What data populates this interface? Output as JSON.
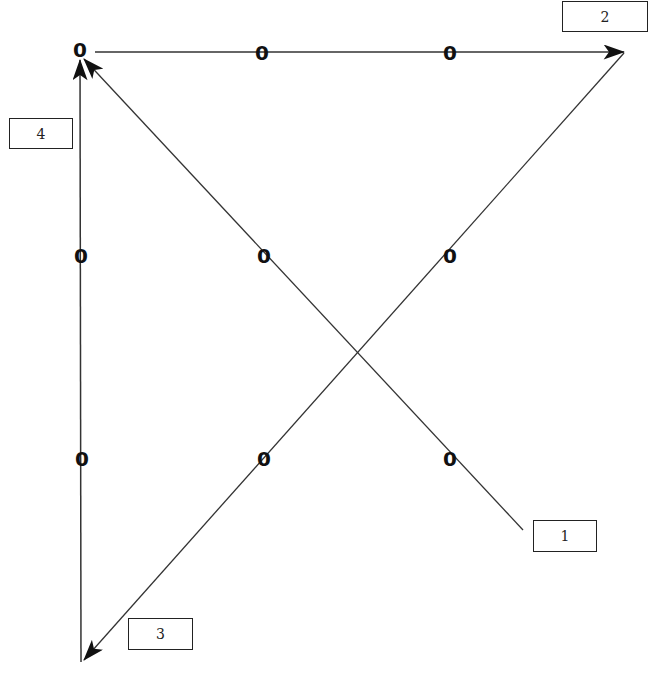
{
  "diagram": {
    "type": "directed-graph",
    "nodes": [
      {
        "id": "1",
        "label": "1",
        "point": [
          524,
          530
        ],
        "box": [
          533,
          520,
          64,
          32
        ]
      },
      {
        "id": "2",
        "label": "2",
        "point": [
          625,
          52
        ],
        "box": [
          562,
          1,
          86,
          31
        ]
      },
      {
        "id": "3",
        "label": "3",
        "point": [
          82,
          662
        ],
        "box": [
          128,
          618,
          65,
          32
        ]
      },
      {
        "id": "4",
        "label": "4",
        "point": [
          80,
          52
        ],
        "box": [
          9,
          118,
          64,
          31
        ]
      }
    ],
    "edges": [
      {
        "from": "1",
        "to": "4",
        "labels": [
          "0",
          "0"
        ]
      },
      {
        "from": "4",
        "to": "2",
        "labels": [
          "0",
          "0"
        ]
      },
      {
        "from": "2",
        "to": "3",
        "labels": [
          "0",
          "0"
        ]
      },
      {
        "from": "3",
        "to": "4",
        "labels": [
          "0",
          "0"
        ]
      }
    ],
    "edge_labels": [
      {
        "text": "0",
        "x": 262,
        "y": 53
      },
      {
        "text": "0",
        "x": 450,
        "y": 53
      },
      {
        "text": "0",
        "x": 81,
        "y": 256
      },
      {
        "text": "0",
        "x": 264,
        "y": 256
      },
      {
        "text": "0",
        "x": 450,
        "y": 256
      },
      {
        "text": "0",
        "x": 82,
        "y": 459
      },
      {
        "text": "0",
        "x": 264,
        "y": 459
      },
      {
        "text": "0",
        "x": 450,
        "y": 459
      }
    ],
    "start_label": {
      "text": "0",
      "x": 80,
      "y": 50
    }
  }
}
